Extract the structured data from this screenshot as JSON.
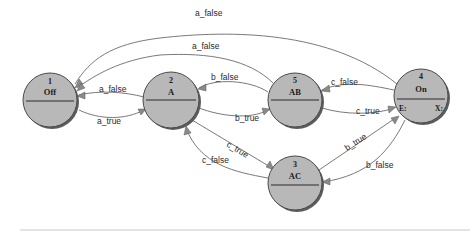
{
  "diagram": {
    "type": "state-machine",
    "nodes": [
      {
        "id": "1",
        "name": "Off",
        "cx": 50,
        "cy": 100
      },
      {
        "id": "2",
        "name": "A",
        "cx": 171,
        "cy": 100
      },
      {
        "id": "5",
        "name": "AB",
        "cx": 295,
        "cy": 100
      },
      {
        "id": "4",
        "name": "On",
        "cx": 421,
        "cy": 96,
        "entry_label": "E:",
        "exit_label": "X:"
      },
      {
        "id": "3",
        "name": "AC",
        "cx": 295,
        "cy": 183
      }
    ],
    "edges": [
      {
        "from": "4",
        "to": "1",
        "label": "a_false"
      },
      {
        "from": "5",
        "to": "1",
        "label": "a_false"
      },
      {
        "from": "2",
        "to": "1",
        "label": "a_false"
      },
      {
        "from": "1",
        "to": "2",
        "label": "a_true"
      },
      {
        "from": "5",
        "to": "2",
        "label": "b_false"
      },
      {
        "from": "2",
        "to": "5",
        "label": "b_true"
      },
      {
        "from": "4",
        "to": "5",
        "label": "c_false"
      },
      {
        "from": "5",
        "to": "4",
        "label": "c_true"
      },
      {
        "from": "2",
        "to": "3",
        "label": "c_true"
      },
      {
        "from": "3",
        "to": "2",
        "label": "c_false"
      },
      {
        "from": "3",
        "to": "4",
        "label": "b_true"
      },
      {
        "from": "4",
        "to": "3",
        "label": "b_false"
      }
    ],
    "colors": {
      "node_fill": "#b8b8b8",
      "node_shadow": "#5c5c5c",
      "edge": "#6a6a6a",
      "text": "#1a1a1a"
    }
  }
}
